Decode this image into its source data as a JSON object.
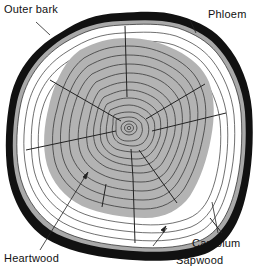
{
  "labels": {
    "outer_bark": "Outer bark",
    "phloem": "Phloem",
    "heartwood": "Heartwood",
    "cambium": "Cambium",
    "sapwood": "Sapwood"
  },
  "colors": {
    "bark": "#111111",
    "phloem": "#a9a9a9",
    "sapwood": "#ffffff",
    "heartwood": "#b3b3b3",
    "ring_line": "#3a3a3a",
    "text": "#111111"
  }
}
